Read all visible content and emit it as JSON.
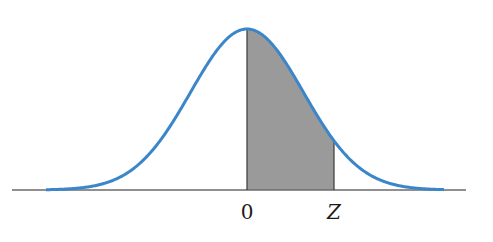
{
  "chart_data": {
    "type": "area",
    "title": "",
    "xlabel": "",
    "ylabel": "",
    "tick_labels": [
      "0",
      "Z"
    ],
    "distribution": {
      "name": "standard normal",
      "mean": 0,
      "sd": 1
    },
    "x_range": [
      -3.56,
      3.5
    ],
    "shaded_region": {
      "from": 0,
      "to": "Z",
      "z_estimate": 1.54
    },
    "grid": false,
    "legend": null
  },
  "labels": {
    "zero": "0",
    "z": "Z"
  },
  "colors": {
    "curve": "#3a86c8",
    "shade": "#9a9a9a",
    "axis": "#6b6b6b",
    "edge": "#3a3a3a"
  },
  "geometry": {
    "axis_y": 190,
    "axis_x0": 12,
    "axis_x1": 466,
    "mean_x": 247,
    "peak_y": 29,
    "sigma_px": 56.5,
    "curve_x0": 46,
    "curve_x1": 444,
    "z_x": 334
  }
}
